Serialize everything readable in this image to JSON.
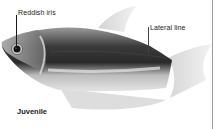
{
  "figure": {
    "callouts": [
      {
        "id": "iris",
        "label": "Reddish iris"
      },
      {
        "id": "lateral",
        "label": "Lateral line"
      }
    ],
    "caption": "Juvenile"
  },
  "colors": {
    "background": "#ffffff",
    "text": "#222222",
    "fish_dark": "#1e1e1e",
    "fish_mid": "#8a8a8a",
    "fish_light": "#d8d8d8"
  }
}
